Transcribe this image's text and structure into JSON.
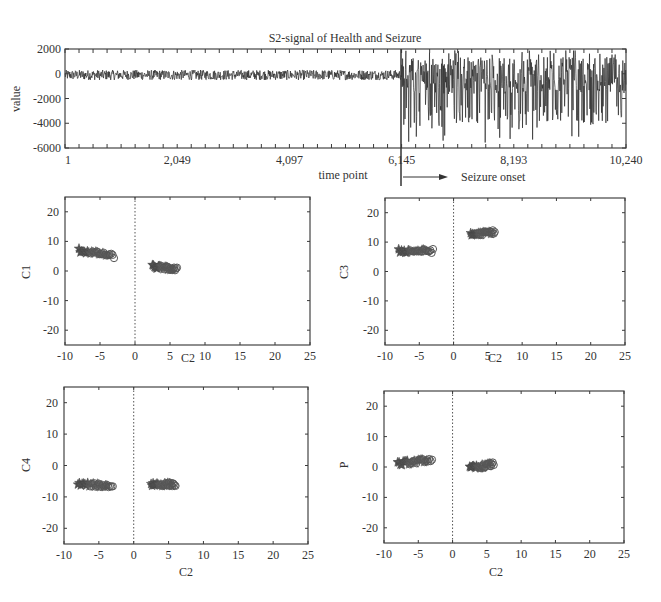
{
  "chart_data": [
    {
      "id": "signal",
      "type": "line",
      "title": "S2-signal of Health and Seizure",
      "xlabel": "time point",
      "ylabel": "value",
      "xlim": [
        1,
        10240
      ],
      "ylim": [
        -6000,
        2000
      ],
      "xticks": [
        1,
        2049,
        4097,
        6145,
        8193,
        10240
      ],
      "xtick_labels": [
        "1",
        "2,049",
        "4,097",
        "6,145",
        "8,193",
        "10,240"
      ],
      "yticks": [
        2000,
        0,
        -2000,
        -4000,
        -6000
      ],
      "ytick_labels": [
        "2000",
        "0",
        "-2000",
        "-4000",
        "-6000"
      ],
      "annotation": {
        "x": 6145,
        "label": "Seizure onset"
      },
      "segments": [
        {
          "name": "Health",
          "x_range": [
            1,
            6145
          ],
          "mean": -100,
          "amplitude": 450,
          "min": -1200,
          "max": 800
        },
        {
          "name": "Seizure",
          "x_range": [
            6145,
            10240
          ],
          "mean": -300,
          "amplitude": 1500,
          "min": -5600,
          "max": 1900
        }
      ],
      "grid": false
    },
    {
      "id": "c1-vs-c2",
      "type": "scatter",
      "xlabel": "C2",
      "ylabel": "C1",
      "xlim": [
        -10,
        25
      ],
      "ylim": [
        -25,
        25
      ],
      "xticks": [
        -10,
        -5,
        0,
        5,
        10,
        15,
        20,
        25
      ],
      "yticks": [
        20,
        10,
        0,
        -10,
        -20
      ],
      "zero_line_x": 0,
      "clusters": [
        {
          "label": "Health",
          "x_range": [
            -8,
            -3
          ],
          "y_start": 7,
          "y_end": 5
        },
        {
          "label": "Seizure",
          "x_range": [
            2.5,
            6
          ],
          "y_start": 1.5,
          "y_end": 0.5
        }
      ]
    },
    {
      "id": "c3-vs-c2",
      "type": "scatter",
      "xlabel": "C2",
      "ylabel": "C3",
      "xlim": [
        -10,
        25
      ],
      "ylim": [
        -25,
        25
      ],
      "xticks": [
        -10,
        -5,
        0,
        5,
        10,
        15,
        20,
        25
      ],
      "yticks": [
        20,
        10,
        0,
        -10,
        -20
      ],
      "zero_line_x": 0,
      "clusters": [
        {
          "label": "Health",
          "x_range": [
            -8,
            -3
          ],
          "y_start": 7,
          "y_end": 7
        },
        {
          "label": "Seizure",
          "x_range": [
            2.5,
            6
          ],
          "y_start": 12.5,
          "y_end": 13.5
        }
      ]
    },
    {
      "id": "c4-vs-c2",
      "type": "scatter",
      "xlabel": "C2",
      "ylabel": "C4",
      "xlim": [
        -10,
        25
      ],
      "ylim": [
        -25,
        25
      ],
      "xticks": [
        -10,
        -5,
        0,
        5,
        10,
        15,
        20,
        25
      ],
      "yticks": [
        20,
        10,
        0,
        -10,
        -20
      ],
      "zero_line_x": 0,
      "clusters": [
        {
          "label": "Health",
          "x_range": [
            -8,
            -3
          ],
          "y_start": -6,
          "y_end": -6.5
        },
        {
          "label": "Seizure",
          "x_range": [
            2.5,
            6
          ],
          "y_start": -6,
          "y_end": -6
        }
      ]
    },
    {
      "id": "p-vs-c2",
      "type": "scatter",
      "xlabel": "C2",
      "ylabel": "P",
      "xlim": [
        -10,
        25
      ],
      "ylim": [
        -25,
        25
      ],
      "xticks": [
        -10,
        -5,
        0,
        5,
        10,
        15,
        20,
        25
      ],
      "yticks": [
        20,
        10,
        0,
        -10,
        -20
      ],
      "zero_line_x": 0,
      "clusters": [
        {
          "label": "Health",
          "x_range": [
            -8,
            -3
          ],
          "y_start": 1,
          "y_end": 2.5
        },
        {
          "label": "Seizure",
          "x_range": [
            2.5,
            6
          ],
          "y_start": -0.5,
          "y_end": 1
        }
      ]
    }
  ],
  "markers": {
    "start_marker": "star",
    "end_marker": "circle"
  },
  "colors": {
    "ink": "#3a3a3a",
    "frame": "#444444",
    "background": "#ffffff"
  }
}
